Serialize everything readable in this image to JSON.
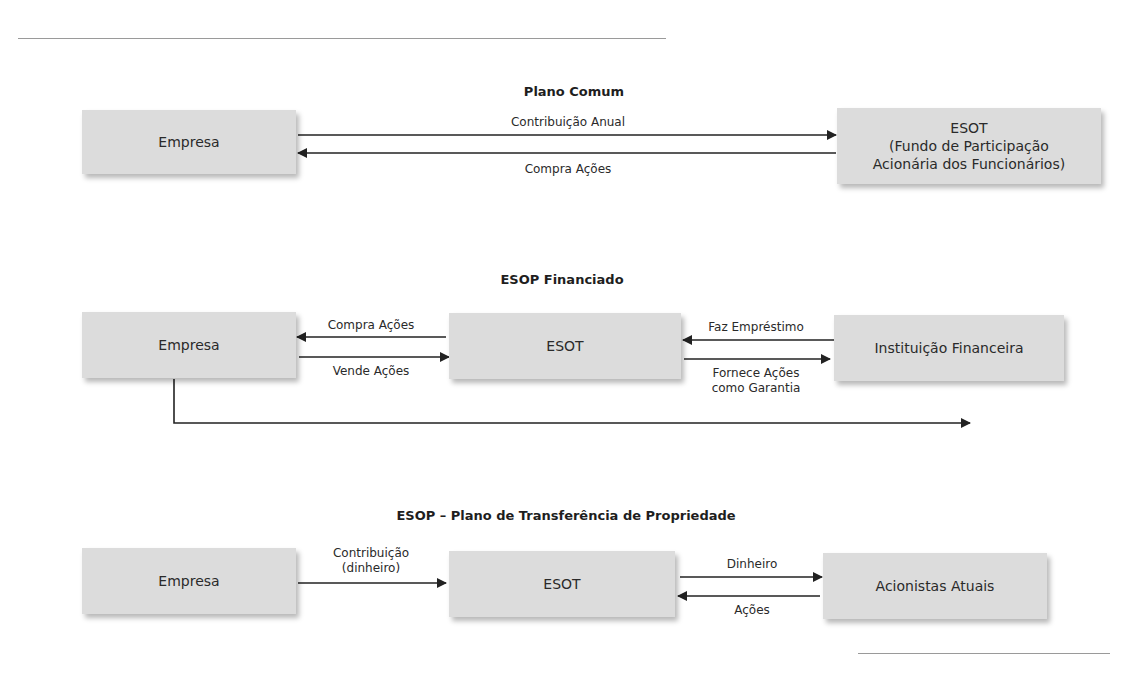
{
  "diagrams": [
    {
      "title": "Plano Comum",
      "nodes": [
        {
          "id": "empresa",
          "label": "Empresa"
        },
        {
          "id": "esot",
          "label": "ESOT\n(Fundo de Participação\nAcionária dos Funcionários)",
          "lines": [
            "ESOT",
            "(Fundo de Participação",
            "Acionária dos Funcionários)"
          ]
        }
      ],
      "edges": [
        {
          "from": "empresa",
          "to": "esot",
          "label": "Contribuição Anual"
        },
        {
          "from": "esot",
          "to": "empresa",
          "label": "Compra Ações"
        }
      ]
    },
    {
      "title": "ESOP Financiado",
      "nodes": [
        {
          "id": "empresa",
          "label": "Empresa"
        },
        {
          "id": "esot",
          "label": "ESOT"
        },
        {
          "id": "instituicao",
          "label": "Instituição Financeira"
        }
      ],
      "edges": [
        {
          "from": "esot",
          "to": "empresa",
          "label": "Compra Ações"
        },
        {
          "from": "empresa",
          "to": "esot",
          "label": "Vende Ações"
        },
        {
          "from": "instituicao",
          "to": "esot",
          "label": "Faz Empréstimo"
        },
        {
          "from": "esot",
          "to": "instituicao",
          "label": "Fornece Ações como Garantia",
          "lines": [
            "Fornece Ações",
            "como Garantia"
          ]
        },
        {
          "from": "empresa",
          "to": "right-edge",
          "label": ""
        }
      ]
    },
    {
      "title": "ESOP – Plano de Transferência de Propriedade",
      "nodes": [
        {
          "id": "empresa",
          "label": "Empresa"
        },
        {
          "id": "esot",
          "label": "ESOT"
        },
        {
          "id": "acionistas",
          "label": "Acionistas Atuais"
        }
      ],
      "edges": [
        {
          "from": "empresa",
          "to": "esot",
          "label": "Contribuição (dinheiro)",
          "lines": [
            "Contribuição",
            "(dinheiro)"
          ]
        },
        {
          "from": "esot",
          "to": "acionistas",
          "label": "Dinheiro"
        },
        {
          "from": "acionistas",
          "to": "esot",
          "label": "Ações"
        }
      ]
    }
  ],
  "colors": {
    "box": "#dcdcdc",
    "line": "#222222",
    "rule": "#9a9a9a"
  }
}
